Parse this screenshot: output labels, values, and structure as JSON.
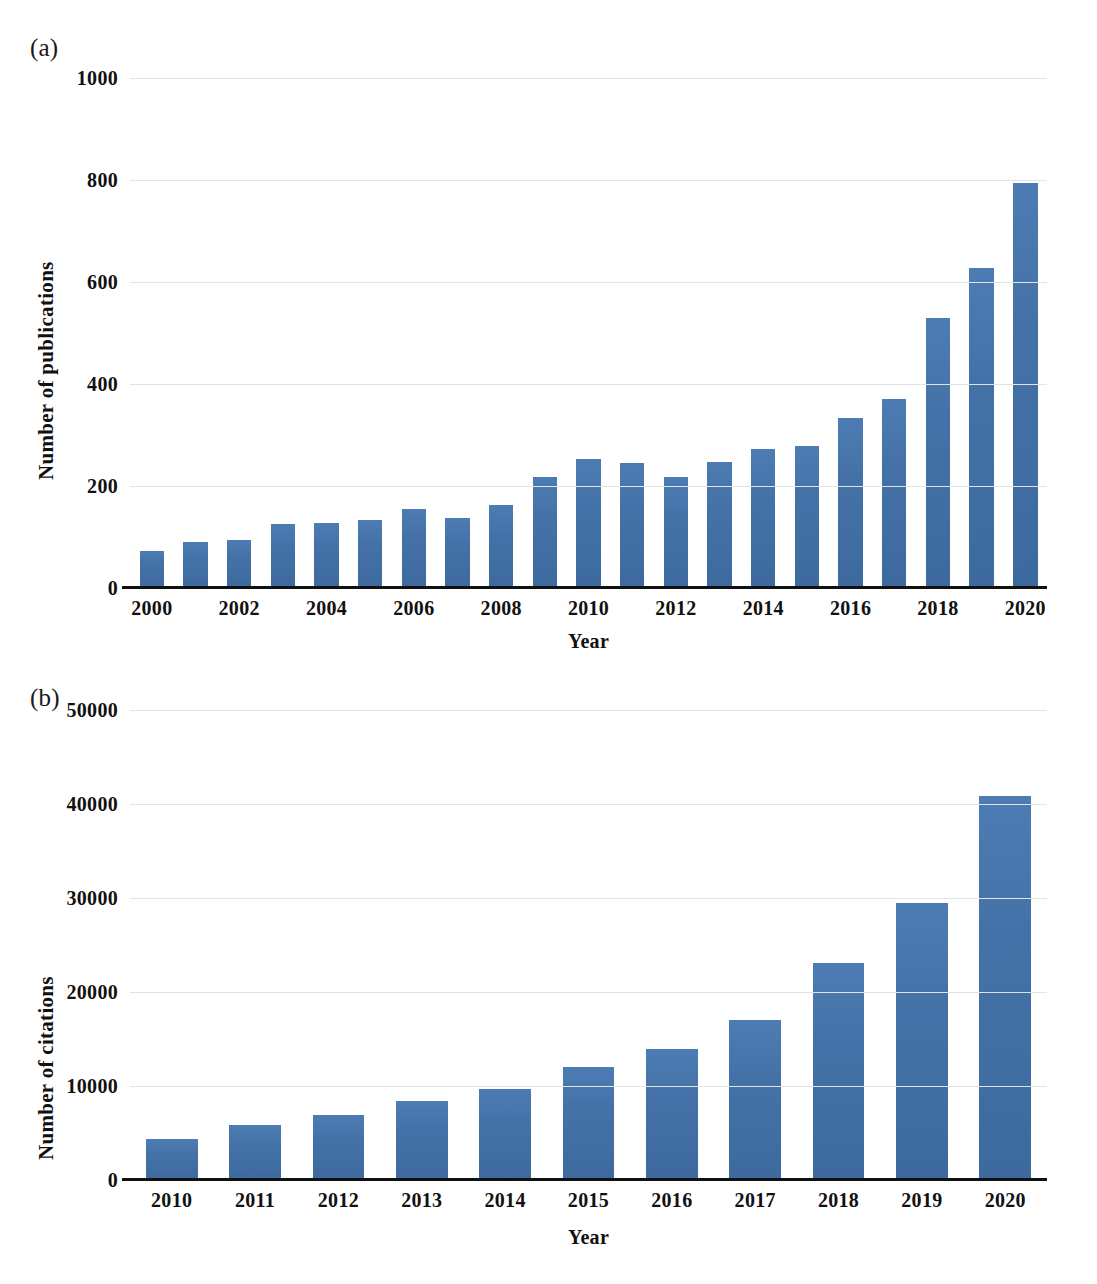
{
  "figure": {
    "background": "#ffffff",
    "bar_color": "#4472a8",
    "gridline_color": "#e3e3e3",
    "axis_color": "#111111"
  },
  "panels": [
    {
      "label": "(a)"
    },
    {
      "label": "(b)"
    }
  ],
  "chart_data": [
    {
      "type": "bar",
      "panel": "(a)",
      "title": "",
      "xlabel": "Year",
      "ylabel": "Number of publications",
      "ylim": [
        0,
        1000
      ],
      "yticks": [
        "0",
        "200",
        "400",
        "600",
        "800",
        "1000"
      ],
      "ytick_values": [
        0,
        200,
        400,
        600,
        800,
        1000
      ],
      "grid": true,
      "legend": "none",
      "categories": [
        "2000",
        "2001",
        "2002",
        "2003",
        "2004",
        "2005",
        "2006",
        "2007",
        "2008",
        "2009",
        "2010",
        "2011",
        "2012",
        "2013",
        "2014",
        "2015",
        "2016",
        "2017",
        "2018",
        "2019",
        "2020"
      ],
      "xtick_labels": [
        "2000",
        "",
        "2002",
        "",
        "2004",
        "",
        "2006",
        "",
        "2008",
        "",
        "2010",
        "",
        "2012",
        "",
        "2014",
        "",
        "2016",
        "",
        "2018",
        "",
        "2020"
      ],
      "values": [
        72,
        90,
        95,
        125,
        127,
        133,
        155,
        137,
        163,
        218,
        252,
        245,
        218,
        247,
        273,
        278,
        333,
        370,
        530,
        628,
        795
      ]
    },
    {
      "type": "bar",
      "panel": "(b)",
      "title": "",
      "xlabel": "Year",
      "ylabel": "Number of citations",
      "ylim": [
        0,
        50000
      ],
      "yticks": [
        "0",
        "10000",
        "20000",
        "30000",
        "40000",
        "50000"
      ],
      "ytick_values": [
        0,
        10000,
        20000,
        30000,
        40000,
        50000
      ],
      "grid": true,
      "legend": "none",
      "categories": [
        "2010",
        "2011",
        "2012",
        "2013",
        "2014",
        "2015",
        "2016",
        "2017",
        "2018",
        "2019",
        "2020"
      ],
      "xtick_labels": [
        "2010",
        "2011",
        "2012",
        "2013",
        "2014",
        "2015",
        "2016",
        "2017",
        "2018",
        "2019",
        "2020"
      ],
      "values": [
        4400,
        5900,
        6900,
        8400,
        9700,
        12000,
        13900,
        17000,
        23100,
        29500,
        40800
      ]
    }
  ]
}
